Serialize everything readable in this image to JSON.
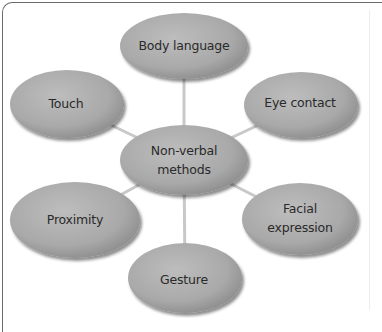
{
  "diagram": {
    "type": "mind-map",
    "colors": {
      "node_fill": "#a9a9a9",
      "node_highlight": "#c4c4c4",
      "node_shadow": "#7c7c7c",
      "connector": "#c8c8c8",
      "text": "#2a2a2a",
      "frame": "#6a6a6a"
    },
    "center": {
      "id": "non-verbal-methods",
      "label_line1": "Non-verbal",
      "label_line2": "methods",
      "cx": 184,
      "cy": 160,
      "rx": 64,
      "ry": 35
    },
    "nodes": [
      {
        "id": "body-language",
        "label": "Body language",
        "cx": 184,
        "cy": 46,
        "rx": 64,
        "ry": 33
      },
      {
        "id": "touch",
        "label": "Touch",
        "cx": 67,
        "cy": 104,
        "rx": 57,
        "ry": 34
      },
      {
        "id": "eye-contact",
        "label": "Eye contact",
        "cx": 301,
        "cy": 105,
        "rx": 57,
        "ry": 33
      },
      {
        "id": "proximity",
        "label": "Proximity",
        "cx": 75,
        "cy": 220,
        "rx": 65,
        "ry": 38
      },
      {
        "id": "facial-expression",
        "label_line1": "Facial",
        "label_line2": "expression",
        "cx": 300,
        "cy": 219,
        "rx": 58,
        "ry": 36
      },
      {
        "id": "gesture",
        "label": "Gesture",
        "cx": 185,
        "cy": 278,
        "rx": 57,
        "ry": 35
      }
    ],
    "edges": [
      {
        "from": "non-verbal-methods",
        "to": "body-language"
      },
      {
        "from": "non-verbal-methods",
        "to": "touch"
      },
      {
        "from": "non-verbal-methods",
        "to": "eye-contact"
      },
      {
        "from": "non-verbal-methods",
        "to": "proximity"
      },
      {
        "from": "non-verbal-methods",
        "to": "facial-expression"
      },
      {
        "from": "non-verbal-methods",
        "to": "gesture"
      }
    ]
  }
}
